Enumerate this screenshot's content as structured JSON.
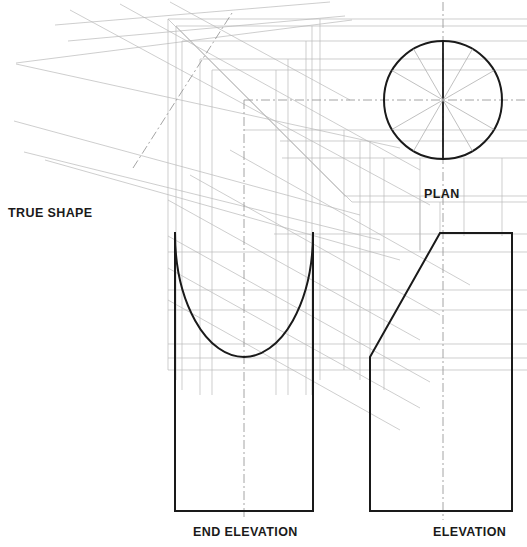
{
  "drawing": {
    "title": "Orthographic projection of a cut cylinder",
    "type": "engineering-orthographic-projection",
    "background_color": "#ffffff",
    "object_line_color": "#1a1a1a",
    "construction_line_color": "#b9b9b9",
    "centre_line_color": "#9a9a9a",
    "text_color": "#1a1a1a"
  },
  "labels": {
    "true_shape": "TRUE SHAPE",
    "plan": "PLAN",
    "end_elevation": "END ELEVATION",
    "elevation": "ELEVATION"
  },
  "views": {
    "plan": {
      "name": "PLAN",
      "shape": "circle",
      "centre_x": 443,
      "centre_y": 100,
      "radius": 59,
      "divisions": 12,
      "division_angle_degrees": 30,
      "has_vertical_centre_line": true,
      "has_horizontal_centre_line": true
    },
    "end_elevation": {
      "name": "END ELEVATION",
      "shape": "rectangle-with-elliptical-cut",
      "left_x": 175,
      "right_x": 313,
      "top_y": 233,
      "bottom_y": 511,
      "cut_lowest_y": 357,
      "cut_curve": "semi-ellipse",
      "has_vertical_centre_line": true
    },
    "elevation": {
      "name": "ELEVATION",
      "shape": "rectangle-with-inclined-cut",
      "left_x": 370,
      "right_x": 512,
      "top_y": 233,
      "bottom_y": 511,
      "cut_start_x": 370,
      "cut_start_y": 357,
      "cut_end_x": 440,
      "cut_end_y": 233,
      "has_vertical_centre_line": true
    },
    "true_shape": {
      "name": "TRUE SHAPE",
      "shape": "auxiliary-projection",
      "projection_angle_degrees": -33,
      "label_x": 8,
      "label_y": 213,
      "has_centre_line": true,
      "centre_line_style": "chain-dash-dot"
    }
  },
  "line_styles": {
    "object": {
      "width": 2.0,
      "dash": "none"
    },
    "construction": {
      "width": 0.7,
      "dash": "none"
    },
    "centre": {
      "width": 0.9,
      "dash": "8 3 2 3"
    },
    "miter_45": {
      "width": 0.7,
      "dash": "none"
    }
  }
}
